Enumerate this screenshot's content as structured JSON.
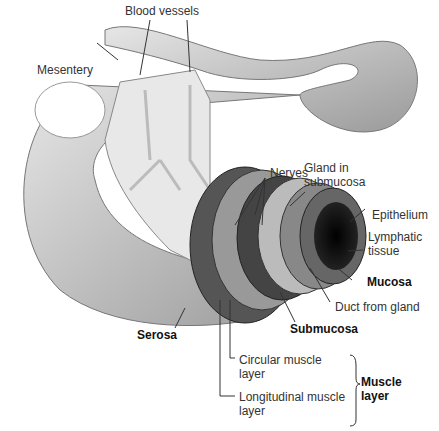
{
  "labels": {
    "blood_vessels": "Blood vessels",
    "mesentery": "Mesentery",
    "nerves": "Nerves",
    "gland_line1": "Gland in",
    "gland_line2": "submucosa",
    "epithelium": "Epithelium",
    "lymphatic_line1": "Lymphatic",
    "lymphatic_line2": "tissue",
    "mucosa": "Mucosa",
    "duct": "Duct from gland",
    "submucosa": "Submucosa",
    "serosa": "Serosa",
    "circular_line1": "Circular muscle",
    "circular_line2": "layer",
    "longitudinal_line1": "Longitudinal muscle",
    "longitudinal_line2": "layer",
    "muscle_line1": "Muscle",
    "muscle_line2": "layer"
  }
}
